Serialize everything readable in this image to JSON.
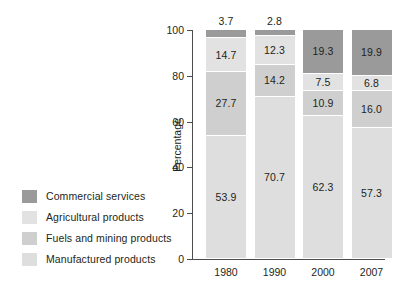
{
  "chart_data": {
    "type": "bar",
    "subtype": "stacked-bar-100",
    "title": "",
    "xlabel": "",
    "ylabel": "Percentage",
    "ylim": [
      0,
      100
    ],
    "yticks": [
      0,
      20,
      40,
      60,
      80,
      100
    ],
    "grid": false,
    "legend_position": "left",
    "categories": [
      "1980",
      "1990",
      "2000",
      "2007"
    ],
    "series": [
      {
        "name": "Commercial services",
        "color": "#9a9a9a",
        "values": [
          3.7,
          2.8,
          19.3,
          19.9
        ],
        "labels": [
          "3.7",
          "2.8",
          "19.3",
          "19.9"
        ],
        "label_placement": [
          "above",
          "above",
          "inside",
          "inside"
        ]
      },
      {
        "name": "Agricultural products",
        "color": "#e2e2e2",
        "values": [
          14.7,
          12.3,
          7.5,
          6.8
        ],
        "labels": [
          "14.7",
          "12.3",
          "7.5",
          "6.8"
        ],
        "label_placement": [
          "inside",
          "inside",
          "inside",
          "inside"
        ]
      },
      {
        "name": "Fuels and mining products",
        "color": "#cfcfcf",
        "values": [
          27.7,
          14.2,
          10.9,
          16.0
        ],
        "labels": [
          "27.7",
          "14.2",
          "10.9",
          "16.0"
        ],
        "label_placement": [
          "inside",
          "inside",
          "inside",
          "inside"
        ]
      },
      {
        "name": "Manufactured products",
        "color": "#dedede",
        "values": [
          53.9,
          70.7,
          62.3,
          57.3
        ],
        "labels": [
          "53.9",
          "70.7",
          "62.3",
          "57.3"
        ],
        "label_placement": [
          "inside",
          "inside",
          "inside",
          "inside"
        ]
      }
    ]
  },
  "legend": {
    "items": [
      {
        "label": "Commercial services",
        "color": "#9a9a9a"
      },
      {
        "label": "Agricultural products",
        "color": "#e2e2e2"
      },
      {
        "label": "Fuels and mining products",
        "color": "#cfcfcf"
      },
      {
        "label": "Manufactured products",
        "color": "#dedede"
      }
    ]
  },
  "axes": {
    "y_label": "Percentage",
    "y_ticks": [
      "0",
      "20",
      "40",
      "60",
      "80",
      "100"
    ],
    "x_ticks": [
      "1980",
      "1990",
      "2000",
      "2007"
    ]
  }
}
